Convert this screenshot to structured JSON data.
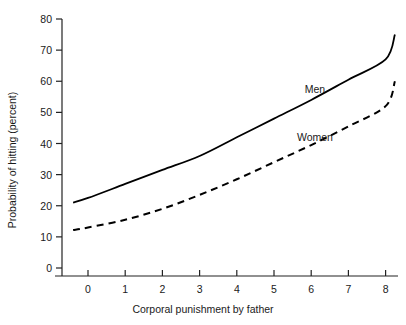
{
  "chart_data": {
    "type": "line",
    "title": "",
    "xlabel": "Corporal punishment by father",
    "ylabel": "Probability of hitting (percent)",
    "xlim": [
      -0.4,
      8.3
    ],
    "ylim": [
      0,
      80
    ],
    "xticks": [
      0,
      1,
      2,
      3,
      4,
      5,
      6,
      7,
      8
    ],
    "xticklabels": [
      "0",
      "1",
      "2",
      "3",
      "4",
      "5",
      "6",
      "7",
      "8"
    ],
    "yticks": [
      0,
      10,
      20,
      30,
      40,
      50,
      60,
      70,
      80
    ],
    "yticklabels": [
      "0",
      "10",
      "20",
      "30",
      "40",
      "50",
      "60",
      "70",
      "80"
    ],
    "grid": false,
    "legend_position": "inline-annotation",
    "x": [
      -0.4,
      0,
      1,
      2,
      3,
      4,
      5,
      6,
      7,
      8,
      8.25
    ],
    "series": [
      {
        "name": "Men",
        "style": "solid",
        "color": "#000000",
        "values": [
          21,
          22.5,
          27,
          31.5,
          36,
          42,
          48,
          54,
          60.5,
          67,
          75
        ],
        "label_x": 6.1,
        "label_y": 57.5
      },
      {
        "name": "Women",
        "style": "dashed",
        "color": "#000000",
        "values": [
          12.2,
          13,
          15.5,
          19,
          23.5,
          28.5,
          34,
          39.5,
          45.5,
          52,
          60
        ],
        "label_x": 6.1,
        "label_y": 42
      }
    ],
    "annotations": [
      {
        "text": "Men",
        "x": 6.1,
        "y": 57.5
      },
      {
        "text": "Women",
        "x": 6.1,
        "y": 42
      }
    ]
  },
  "geometry": {
    "plot_left": 62,
    "plot_right": 398,
    "plot_bottom": 268,
    "plot_top": 19,
    "axis_baseline_y": 276,
    "x0_px": 88,
    "x_unit_px": 37.2,
    "y0_px": 268,
    "y_unit_px": 3.1125
  }
}
